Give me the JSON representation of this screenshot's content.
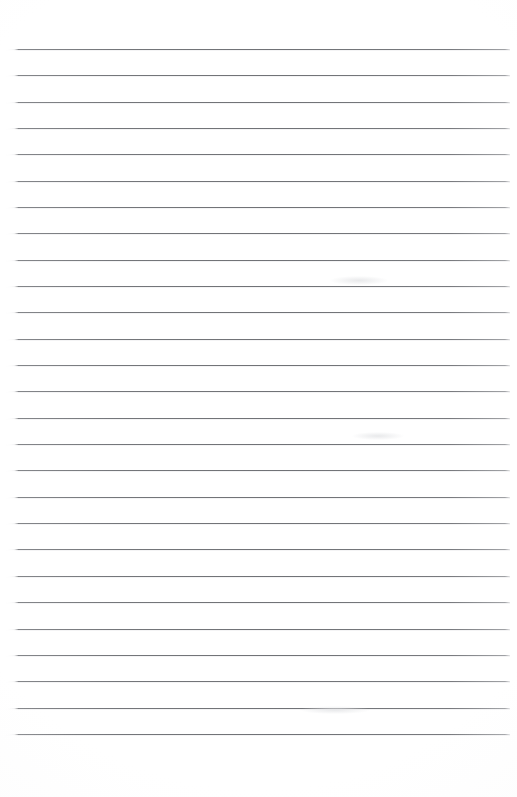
{
  "document": {
    "type": "lined-paper",
    "title": "Blank ruled notebook page",
    "description": "Scanned sheet of blank lined writing paper with horizontal ruling and no written content",
    "page_width_px": 517,
    "page_height_px": 797,
    "background_color": "#ffffff",
    "content_text": ""
  },
  "ruling": {
    "line_count": 27,
    "first_line_y_px": 49,
    "last_line_y_px": 734,
    "line_spacing_px": 26.35,
    "line_start_x_px": 6,
    "line_end_x_px": 510,
    "line_thickness_px": 1,
    "line_color": "#74767a",
    "top_margin_px": 49,
    "bottom_margin_px": 63,
    "left_margin_px": 6,
    "right_margin_px": 7,
    "has_vertical_margin_rule": false,
    "lines": [
      {
        "index": 1,
        "y": 49
      },
      {
        "index": 2,
        "y": 75
      },
      {
        "index": 3,
        "y": 102
      },
      {
        "index": 4,
        "y": 128
      },
      {
        "index": 5,
        "y": 154
      },
      {
        "index": 6,
        "y": 181
      },
      {
        "index": 7,
        "y": 207
      },
      {
        "index": 8,
        "y": 233
      },
      {
        "index": 9,
        "y": 260
      },
      {
        "index": 10,
        "y": 286
      },
      {
        "index": 11,
        "y": 312
      },
      {
        "index": 12,
        "y": 339
      },
      {
        "index": 13,
        "y": 365
      },
      {
        "index": 14,
        "y": 391
      },
      {
        "index": 15,
        "y": 418
      },
      {
        "index": 16,
        "y": 444
      },
      {
        "index": 17,
        "y": 470
      },
      {
        "index": 18,
        "y": 497
      },
      {
        "index": 19,
        "y": 523
      },
      {
        "index": 20,
        "y": 549
      },
      {
        "index": 21,
        "y": 576
      },
      {
        "index": 22,
        "y": 602
      },
      {
        "index": 23,
        "y": 629
      },
      {
        "index": 24,
        "y": 655
      },
      {
        "index": 25,
        "y": 681
      },
      {
        "index": 26,
        "y": 708
      },
      {
        "index": 27,
        "y": 734
      }
    ]
  },
  "artifacts": [
    {
      "name": "scan-smudge-upper",
      "x": 330,
      "y": 276,
      "width": 58,
      "height": 9
    },
    {
      "name": "scan-smudge-mid",
      "x": 352,
      "y": 432,
      "width": 52,
      "height": 8
    },
    {
      "name": "scan-smudge-lower",
      "x": 300,
      "y": 706,
      "width": 70,
      "height": 8
    }
  ]
}
